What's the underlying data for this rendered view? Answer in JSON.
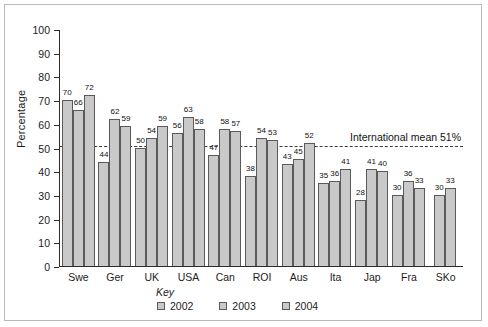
{
  "chart_data": {
    "type": "bar",
    "title": "",
    "xlabel": "",
    "ylabel": "Percentage",
    "ylim": [
      0,
      100
    ],
    "ytick_step": 10,
    "yticks": [
      0,
      10,
      20,
      30,
      40,
      50,
      60,
      70,
      80,
      90,
      100
    ],
    "grid": false,
    "legend_position": "bottom",
    "legend_title": "Key",
    "categories": [
      "Swe",
      "Ger",
      "UK",
      "USA",
      "Can",
      "ROI",
      "Aus",
      "Ita",
      "Jap",
      "Fra",
      "SKo"
    ],
    "series": [
      {
        "name": "2002",
        "values": [
          70,
          44,
          50,
          56,
          47,
          38,
          43,
          35,
          28,
          30,
          null
        ]
      },
      {
        "name": "2003",
        "values": [
          66,
          62,
          54,
          63,
          58,
          54,
          45,
          36,
          41,
          36,
          30
        ]
      },
      {
        "name": "2004",
        "values": [
          72,
          59,
          59,
          58,
          57,
          53,
          52,
          41,
          40,
          33,
          33
        ]
      }
    ],
    "annotations": [
      {
        "type": "hline",
        "value": 51,
        "label": "International mean 51%",
        "style": "dashed"
      }
    ],
    "colors": {
      "bar_fill": "#c9c9c9",
      "bar_stroke": "#5a5a5a",
      "axis": "#2b2b2b",
      "mean_line": "#3a3a3a",
      "text": "#1c1c1c",
      "frame": "#b9b9b9",
      "background": "#ffffff"
    }
  }
}
